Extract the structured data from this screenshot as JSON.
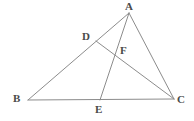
{
  "figure": {
    "kind": "geometry-diagram",
    "shape_name": "triangle-with-cevians",
    "background_color": "#ffffff",
    "stroke_color": "#8c8c8c",
    "label_color": "#4a4a4a",
    "stroke_width": 1,
    "canvas": {
      "width": 194,
      "height": 121
    }
  },
  "points": [
    {
      "id": "A",
      "label": "A",
      "x": 129,
      "y": 13,
      "label_x": 125,
      "label_y": 1,
      "role": "triangle-vertex"
    },
    {
      "id": "B",
      "label": "B",
      "x": 28,
      "y": 100,
      "label_x": 13,
      "label_y": 93,
      "role": "triangle-vertex"
    },
    {
      "id": "C",
      "label": "C",
      "x": 174,
      "y": 99,
      "label_x": 177,
      "label_y": 94,
      "role": "triangle-vertex"
    },
    {
      "id": "D",
      "label": "D",
      "x": 96,
      "y": 41,
      "label_x": 82,
      "label_y": 31,
      "role": "point-on-segment-AB"
    },
    {
      "id": "E",
      "label": "E",
      "x": 100,
      "y": 100,
      "label_x": 95,
      "label_y": 104,
      "role": "point-on-segment-BC"
    },
    {
      "id": "F",
      "label": "F",
      "x": 117,
      "y": 55,
      "label_x": 120,
      "label_y": 45,
      "role": "intersection-of-AE-and-DC"
    }
  ],
  "segments": [
    {
      "id": "BA",
      "from": "B",
      "to": "A",
      "description": "side B to A through D"
    },
    {
      "id": "BC",
      "from": "B",
      "to": "C",
      "description": "base B to C through E"
    },
    {
      "id": "AC",
      "from": "A",
      "to": "C",
      "description": "side A to C"
    },
    {
      "id": "AE",
      "from": "A",
      "to": "E",
      "description": "cevian A to E through F"
    },
    {
      "id": "DC",
      "from": "D",
      "to": "C",
      "description": "cevian D to C through F"
    }
  ],
  "labels_text": [
    "A",
    "B",
    "C",
    "D",
    "E",
    "F"
  ]
}
